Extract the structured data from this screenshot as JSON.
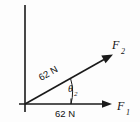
{
  "figure": {
    "kind": "force-vector-diagram",
    "background_color": "#fdfdfd",
    "line_color": "#1a1a1a",
    "width": 140,
    "height": 122
  },
  "axes": {
    "vertical": {
      "name": "vertical-axis",
      "x": 25,
      "y_top": 5,
      "y_bottom": 112
    },
    "horizontal": {
      "name": "horizontal-axis",
      "y": 104,
      "x_left": 19,
      "x_right": 110
    }
  },
  "vectors": [
    {
      "id": "f1",
      "label": "F",
      "subscript": "1",
      "direction_deg": 0,
      "magnitude_label": "62 N",
      "origin": [
        25,
        104
      ],
      "tip": [
        110,
        104
      ],
      "label_pos": [
        120,
        108
      ]
    },
    {
      "id": "f2",
      "label": "F",
      "subscript": "2",
      "direction_deg": 28,
      "magnitude_label": "62 N",
      "origin": [
        25,
        104
      ],
      "tip": [
        112,
        55
      ],
      "label_pos": [
        117,
        45
      ]
    }
  ],
  "angle": {
    "name": "theta-2",
    "symbol": "θ",
    "subscript": "2",
    "between": [
      "f1",
      "f2"
    ],
    "label_pos": [
      73,
      88
    ],
    "arc_radius": 45
  },
  "labels": {
    "f1_name": "F",
    "f1_sub": "1",
    "f2_name": "F",
    "f2_sub": "2",
    "theta_symbol": "θ",
    "theta_sub": "2",
    "magnitude_diagonal": "62 N",
    "magnitude_horizontal": "62 N"
  }
}
